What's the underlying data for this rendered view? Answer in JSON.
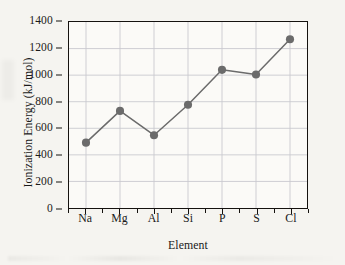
{
  "chart_data": {
    "type": "line",
    "title": "",
    "xlabel": "Element",
    "ylabel": "Ionization Energy (kJ/mol)",
    "categories": [
      "Na",
      "Mg",
      "Al",
      "Si",
      "P",
      "S",
      "Cl"
    ],
    "values": [
      492,
      731,
      548,
      777,
      1040,
      1005,
      1270
    ],
    "series": [
      {
        "name": "Ionization Energy",
        "values": [
          492,
          731,
          548,
          777,
          1040,
          1005,
          1270
        ]
      }
    ],
    "ylim": [
      0,
      1400
    ],
    "y_ticks": [
      0,
      200,
      400,
      600,
      800,
      1000,
      1200,
      1400
    ],
    "y_tick_labels": [
      "0",
      "200",
      "400",
      "600",
      "800",
      "1000",
      "1200",
      "1400"
    ],
    "x_tick_labels": [
      "Na",
      "Mg",
      "Al",
      "Si",
      "P",
      "S",
      "Cl"
    ],
    "grid": true,
    "grid_color": "#c9c9cf",
    "legend": false,
    "legend_position": "none",
    "marker": "circle",
    "marker_color": "#6b6b6b",
    "line_color": "#6b6b6b",
    "axis_color": "#15120f",
    "plot_background": "#fbfaf7",
    "page_background": "#f5f4f0"
  }
}
